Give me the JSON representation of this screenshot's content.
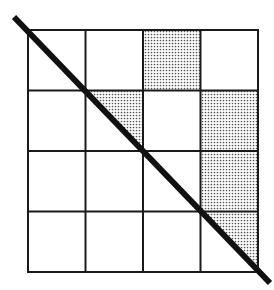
{
  "diagram": {
    "type": "grid-with-diagonal",
    "rows": 4,
    "cols": 4,
    "grid": {
      "x0": 28,
      "y0": 30,
      "x1": 258,
      "y1": 272
    },
    "line_color": "#1a1a1a",
    "shade_color": "#999999",
    "diagonal": {
      "x1": 14,
      "y1": 17,
      "x2": 270,
      "y2": 283,
      "width": 6
    },
    "shaded_cells": [
      {
        "row": 0,
        "col": 2,
        "fill": "full"
      },
      {
        "row": 1,
        "col": 1,
        "fill": "upper-right-triangle"
      },
      {
        "row": 1,
        "col": 3,
        "fill": "full"
      },
      {
        "row": 2,
        "col": 3,
        "fill": "full"
      },
      {
        "row": 3,
        "col": 3,
        "fill": "upper-right-triangle"
      }
    ]
  }
}
